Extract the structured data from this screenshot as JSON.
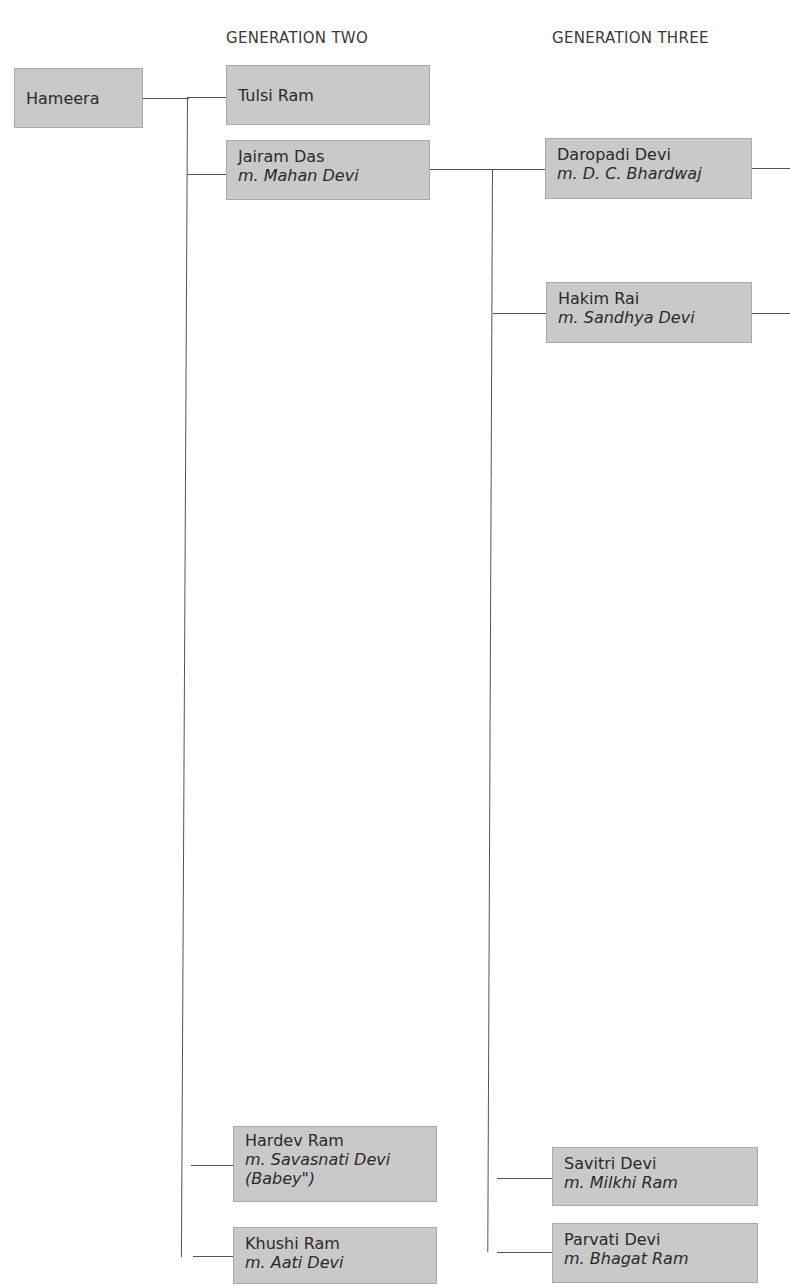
{
  "headers": {
    "gen2": "GENERATION TWO",
    "gen3": "GENERATION THREE"
  },
  "root": {
    "name": "Hameera"
  },
  "generation_two": [
    {
      "name": "Tulsi Ram"
    },
    {
      "name": "Jairam Das",
      "spouse": "m. Mahan Devi"
    },
    {
      "name": "Hardev Ram",
      "spouse": "m. Savasnati Devi",
      "note": "(Babey\")"
    },
    {
      "name": "Khushi Ram",
      "spouse": "m. Aati Devi"
    }
  ],
  "generation_three": [
    {
      "name": "Daropadi Devi",
      "spouse": "m. D. C. Bhardwaj"
    },
    {
      "name": "Hakim Rai",
      "spouse": "m. Sandhya Devi"
    },
    {
      "name": "Savitri Devi",
      "spouse": "m. Milkhi Ram"
    },
    {
      "name": "Parvati Devi",
      "spouse": "m. Bhagat Ram"
    }
  ],
  "colors": {
    "box_fill": "#c9c9c9",
    "box_border": "#a9a9a9",
    "line": "#555555"
  }
}
